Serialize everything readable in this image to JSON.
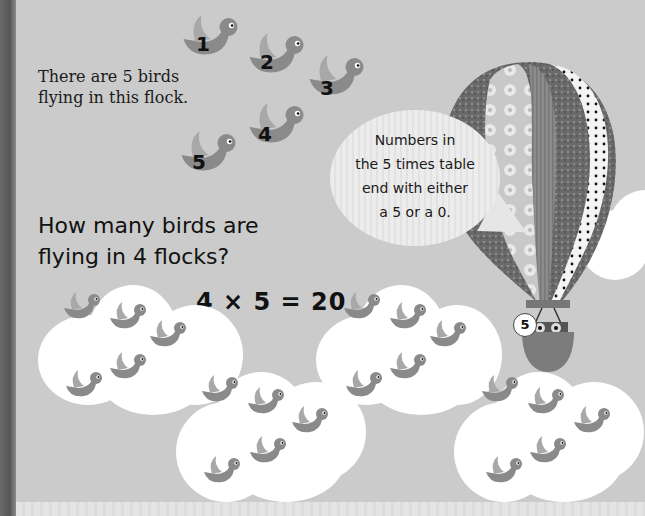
{
  "page": {
    "intro_text": [
      "There are 5 birds",
      "flying in this flock."
    ],
    "numbered_birds": [
      "1",
      "2",
      "3",
      "4",
      "5"
    ],
    "question": [
      "How many birds are",
      "flying in 4 flocks?"
    ],
    "equation": "4 × 5 = 20",
    "speech_bubble": [
      "Numbers in",
      "the 5 times table",
      "end with either",
      "a 5 or a 0."
    ],
    "balloon_badge": "5",
    "flock_count": 4,
    "birds_per_flock": 5
  },
  "colors": {
    "background": "#cbcbcb",
    "spine": "#555555",
    "bird_body": "#8a8a8a",
    "bird_wing": "#a8a8a8",
    "cloud": "#ffffff",
    "text": "#111111"
  }
}
